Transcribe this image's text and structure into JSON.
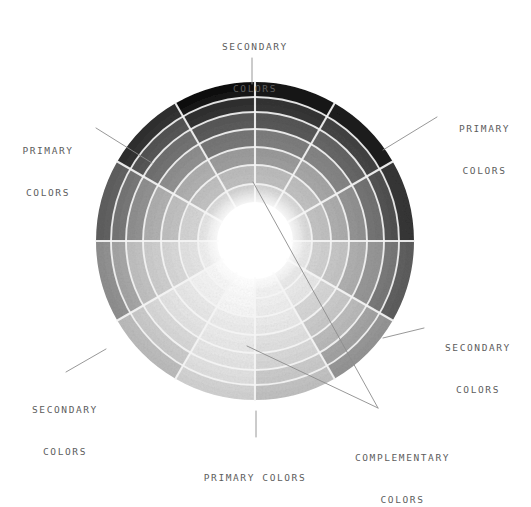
{
  "page": {
    "background": "#ffffff",
    "text_color": "#5d5d5d",
    "leader_color": "#8c8c8c"
  },
  "annotations": {
    "secondary_top": {
      "line1": "SECONDARY",
      "line2": "COLORS"
    },
    "primary_left": {
      "line1": "PRIMARY",
      "line2": "COLORS"
    },
    "primary_right": {
      "line1": "PRIMARY",
      "line2": "COLORS"
    },
    "secondary_right": {
      "line1": "SECONDARY",
      "line2": "COLORS"
    },
    "secondary_left": {
      "line1": "SECONDARY",
      "line2": "COLORS"
    },
    "primary_bottom": {
      "line1": "PRIMARY COLORS",
      "line2": ""
    },
    "complementary": {
      "line1": "COMPLEMENTARY",
      "line2": "COLORS"
    }
  },
  "chart_data": {
    "type": "pie",
    "subtitle": "Grayscale reproduction of a 12-hue, 7-value color wheel",
    "center": {
      "x": 255,
      "y": 241
    },
    "outer_radius": 159,
    "inner_radius": 38,
    "sector_count": 12,
    "ring_count": 7,
    "sector_arc_degrees": 30,
    "start_angle_degrees": -90,
    "grid": true,
    "grid_color": "#efefef",
    "legend_position": "outside-radial",
    "ring_radii": [
      38,
      57,
      76,
      94,
      112,
      129,
      144,
      159
    ],
    "categories": [
      "N (12 o'clock)",
      "NNE",
      "ENE",
      "E",
      "ESE",
      "SSE",
      "S (6 o'clock)",
      "SSW",
      "WSW",
      "W",
      "WNW",
      "NNW"
    ],
    "sector_roles": [
      "secondary",
      "tertiary",
      "primary",
      "tertiary",
      "secondary",
      "tertiary",
      "primary",
      "tertiary",
      "secondary",
      "tertiary",
      "primary",
      "tertiary"
    ],
    "series": [
      {
        "name": "ring-1-innermost",
        "values": [
          212,
          214,
          216,
          228,
          238,
          246,
          250,
          248,
          240,
          228,
          218,
          210
        ]
      },
      {
        "name": "ring-2",
        "values": [
          186,
          190,
          196,
          212,
          228,
          240,
          246,
          242,
          230,
          212,
          196,
          184
        ]
      },
      {
        "name": "ring-3",
        "values": [
          156,
          162,
          172,
          194,
          216,
          232,
          240,
          234,
          218,
          194,
          170,
          152
        ]
      },
      {
        "name": "ring-4",
        "values": [
          122,
          130,
          144,
          172,
          202,
          224,
          234,
          226,
          204,
          170,
          140,
          118
        ]
      },
      {
        "name": "ring-5",
        "values": [
          88,
          96,
          114,
          148,
          186,
          214,
          228,
          216,
          188,
          146,
          110,
          84
        ]
      },
      {
        "name": "ring-6",
        "values": [
          52,
          62,
          84,
          122,
          166,
          202,
          220,
          204,
          168,
          120,
          80,
          48
        ]
      },
      {
        "name": "ring-7-outermost",
        "values": [
          22,
          30,
          52,
          96,
          146,
          188,
          210,
          190,
          146,
          94,
          48,
          18
        ]
      }
    ],
    "value_scale": "0 = black, 255 = white (luminance of the painted hue)",
    "annotation_labels": [
      {
        "text": "SECONDARY COLORS",
        "points_to": "sector N, outer ring"
      },
      {
        "text": "PRIMARY COLORS",
        "points_to": "sector WNW, outer ring"
      },
      {
        "text": "PRIMARY COLORS",
        "points_to": "sector ENE, outer ring"
      },
      {
        "text": "SECONDARY COLORS",
        "points_to": "sector ESE, outer ring"
      },
      {
        "text": "SECONDARY COLORS",
        "points_to": "sector WSW, outer ring"
      },
      {
        "text": "PRIMARY COLORS",
        "points_to": "sector S, outer ring"
      },
      {
        "text": "COMPLEMENTARY COLORS",
        "points_to": "opposing sector pair across center"
      }
    ]
  }
}
